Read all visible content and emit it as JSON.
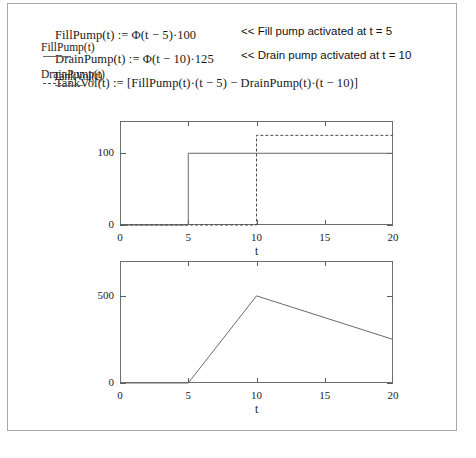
{
  "document": {
    "equations": [
      {
        "id": "fillpump",
        "text": "FillPump(t) := Φ(t − 5)·100"
      },
      {
        "id": "drainpump",
        "text": "DrainPump(t) := Φ(t − 10)·125"
      },
      {
        "id": "tankvol",
        "text": "TankVol(t) := [FillPump(t)·(t − 5) − DrainPump(t)·(t − 10)]"
      }
    ],
    "annotations": [
      {
        "id": "fill-note",
        "text": "<< Fill pump activated at t = 5"
      },
      {
        "id": "drain-note",
        "text": "<< Drain pump activated at t = 10"
      }
    ]
  },
  "chart_data": [
    {
      "type": "line",
      "id": "pumps-chart",
      "title": "",
      "xlabel": "t",
      "ylabel": "",
      "xlim": [
        0,
        20
      ],
      "ylim": [
        0,
        145
      ],
      "grid": false,
      "xticks": [
        0,
        5,
        10,
        15,
        20
      ],
      "xticklabels": [
        "0",
        "5",
        "10",
        "15",
        "20"
      ],
      "yticks": [
        0,
        100
      ],
      "yticklabels": [
        "0",
        "100"
      ],
      "legend_position": "left-outside",
      "series": [
        {
          "name": "FillPump(t)",
          "style": "solid",
          "color": "#6a6a6a",
          "x": [
            0,
            5,
            5,
            20
          ],
          "values": [
            0,
            0,
            100,
            100
          ]
        },
        {
          "name": "DrainPump(t)",
          "style": "dashed",
          "color": "#4a4a4a",
          "x": [
            0,
            10,
            10,
            20
          ],
          "values": [
            0,
            0,
            125,
            125
          ]
        }
      ]
    },
    {
      "type": "line",
      "id": "tankvol-chart",
      "title": "",
      "xlabel": "t",
      "ylabel": "",
      "xlim": [
        0,
        20
      ],
      "ylim": [
        0,
        700
      ],
      "grid": false,
      "xticks": [
        0,
        5,
        10,
        15,
        20
      ],
      "xticklabels": [
        "0",
        "5",
        "10",
        "15",
        "20"
      ],
      "yticks": [
        0,
        500
      ],
      "yticklabels": [
        "0",
        "500"
      ],
      "legend_position": "left-outside",
      "series": [
        {
          "name": "TankVol(t)",
          "style": "solid",
          "color": "#6a6a6a",
          "x": [
            0,
            5,
            10,
            20
          ],
          "values": [
            0,
            0,
            500,
            250
          ]
        }
      ]
    }
  ]
}
